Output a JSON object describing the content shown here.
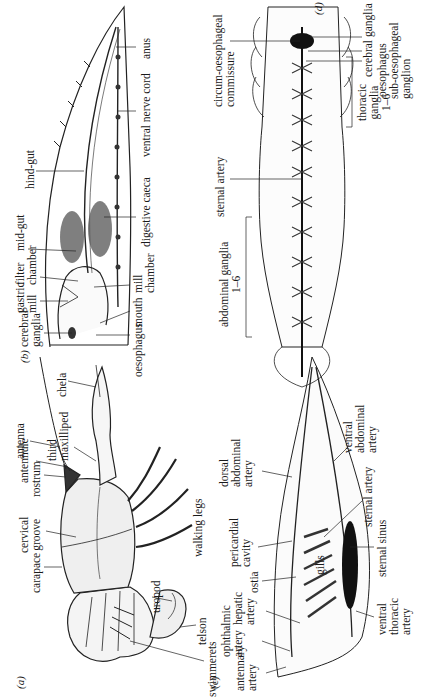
{
  "figure": {
    "panels": [
      {
        "id": "a",
        "tag": "(a)",
        "title": "external view",
        "labels": {
          "carapace": "carapace",
          "cervical_groove": "cervical\ngroove",
          "rostrum": "rostrum",
          "antennule": "antennule",
          "antenna": "antenna",
          "third_maxilliped": "third\nmaxilliped",
          "chela": "chela",
          "walking_legs": "walking legs",
          "uropod": "uropod",
          "telson": "telson",
          "swimmerets": "swimmerets"
        }
      },
      {
        "id": "b",
        "tag": "(b)",
        "labels": {
          "cerebral_ganglia": "cerebral\nganglia",
          "gastric_mill": "gastric\nmill",
          "filter_chamber": "filter\nchamber",
          "mid_gut": "mid-gut",
          "hind_gut": "hind-gut",
          "anus": "anus",
          "ventral_nerve_cord": "ventral nerve cord",
          "digestive_caeca": "digestive caeca",
          "mill_chamber": "mill\nchamber",
          "mouth": "mouth",
          "oesophagus": "oesophagus"
        }
      },
      {
        "id": "c",
        "tag": "(c)",
        "labels": {
          "antennary_artery": "antennary\nartery",
          "ophthalmic_artery": "ophthalmic\nartery",
          "hepatic_artery": "hepatic\nartery",
          "ostia": "ostia",
          "pericardial_cavity": "pericardial\ncavity",
          "dorsal_abdominal_artery": "dorsal\nabdominal\nartery",
          "ventral_abdominal_artery": "ventral\nabdominal\nartery",
          "sternal_artery": "sternal artery",
          "gills": "gills",
          "sternal_sinus": "sternal sinus",
          "ventral_thoracic_artery": "ventral\nthoracic\nartery"
        }
      },
      {
        "id": "d",
        "tag": "(d)",
        "labels": {
          "cerebral_ganglia": "cerebral ganglia",
          "circum_oesophageal_commissure": "circum-oesophageal\ncommissure",
          "oesophagus": "oesophagus",
          "sub_oesophageal_ganglion": "sub-oesophageal\nganglion",
          "thoracic_ganglia": "thoracic\nganglia\n1–6",
          "sternal_artery": "sternal artery",
          "abdominal_ganglia": "abdominal ganglia\n1–6"
        }
      }
    ]
  }
}
